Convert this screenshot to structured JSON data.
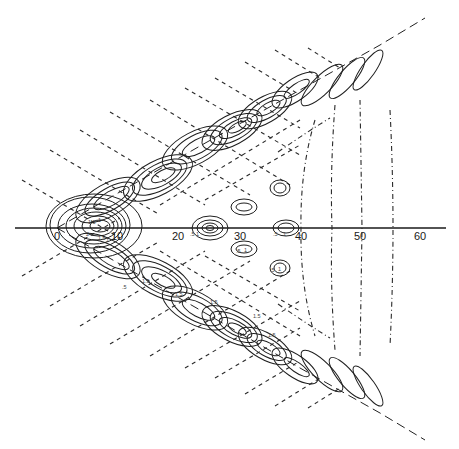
{
  "figure": {
    "axis": {
      "orientation": "horizontal",
      "tick_labels": [
        "0",
        "10",
        "20",
        "30",
        "40",
        "50",
        "60"
      ],
      "tick_values": [
        0,
        10,
        20,
        30,
        40,
        50,
        60
      ]
    },
    "contour_labels": {
      "near_origin": [
        "1.5",
        "1",
        ".5",
        "2",
        "1.5",
        "1",
        ".5"
      ],
      "axis_20": [
        "0",
        ".5",
        "1",
        "1.5"
      ],
      "axis_40": [
        ".5",
        "1"
      ],
      "lower_cells": [
        "1.5",
        "1",
        ".5",
        "1.5",
        "1",
        ".5",
        "1.5",
        "1",
        ".5",
        "1.5",
        "1",
        ".5",
        "1.5",
        "1",
        ".5",
        "1",
        ".5",
        ".5",
        ".5"
      ],
      "small_cells": [
        ".5",
        "1",
        ".5",
        "1"
      ]
    },
    "line_styles": {
      "solid": "contour lines",
      "dashed": "wave crest lines and wedge boundaries",
      "dash_dot": "transverse wave lines"
    },
    "colors": {
      "ink": "#1f1f1f",
      "background": "#ffffff"
    }
  }
}
